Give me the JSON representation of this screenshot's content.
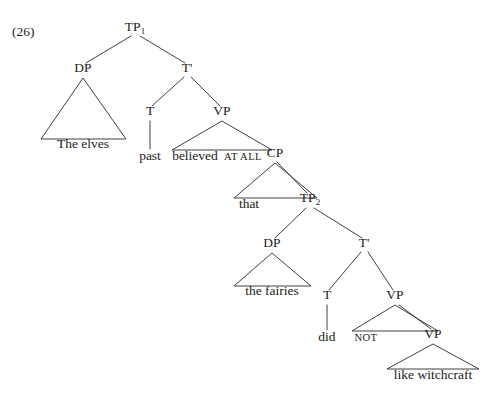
{
  "figure": {
    "example_number": "(26)",
    "caption": "",
    "ink_color": "#1a1a1a",
    "line_color": "#2b2b2b",
    "background_color": "#ffffff"
  },
  "tree": {
    "type": "constituency-syntax-tree",
    "nodes": [
      {
        "id": "tp1",
        "label": "TP",
        "subscript": "1",
        "x": 135,
        "y": 31
      },
      {
        "id": "dp1",
        "label": "DP",
        "subscript": "",
        "x": 83,
        "y": 72
      },
      {
        "id": "tbar1",
        "label": "T'",
        "subscript": "",
        "x": 187,
        "y": 72
      },
      {
        "id": "t1",
        "label": "T",
        "subscript": "",
        "x": 150,
        "y": 115
      },
      {
        "id": "vp1",
        "label": "VP",
        "subscript": "",
        "x": 222,
        "y": 115
      },
      {
        "id": "cp",
        "label": "CP",
        "subscript": "",
        "x": 275,
        "y": 157
      },
      {
        "id": "tp2",
        "label": "TP",
        "subscript": "2",
        "x": 310,
        "y": 202
      },
      {
        "id": "dp2",
        "label": "DP",
        "subscript": "",
        "x": 272,
        "y": 247
      },
      {
        "id": "tbar2",
        "label": "T'",
        "subscript": "",
        "x": 364,
        "y": 247
      },
      {
        "id": "t2",
        "label": "T",
        "subscript": "",
        "x": 327,
        "y": 299
      },
      {
        "id": "vp2",
        "label": "VP",
        "subscript": "",
        "x": 395,
        "y": 299
      },
      {
        "id": "vp3",
        "label": "VP",
        "subscript": "",
        "x": 433,
        "y": 338
      }
    ],
    "leaves": [
      {
        "id": "leaf-the-elves",
        "text": "The elves",
        "x": 83,
        "y": 148,
        "style": "normal"
      },
      {
        "id": "leaf-past",
        "text": "past",
        "x": 150,
        "y": 160,
        "style": "normal"
      },
      {
        "id": "leaf-believed",
        "text": "believed",
        "x": 195,
        "y": 160,
        "style": "normal"
      },
      {
        "id": "leaf-at-all",
        "text": "AT ALL",
        "x": 243,
        "y": 160,
        "style": "smallcaps"
      },
      {
        "id": "leaf-that",
        "text": "that",
        "x": 249,
        "y": 208,
        "style": "normal"
      },
      {
        "id": "leaf-the-fairies",
        "text": "the fairies",
        "x": 272,
        "y": 295,
        "style": "normal"
      },
      {
        "id": "leaf-did",
        "text": "did",
        "x": 327,
        "y": 341,
        "style": "normal"
      },
      {
        "id": "leaf-not",
        "text": "NOT",
        "x": 366,
        "y": 341,
        "style": "smallcaps"
      },
      {
        "id": "leaf-like-witchcraft",
        "text": "like witchcraft",
        "x": 433,
        "y": 379,
        "style": "normal"
      }
    ],
    "branches": [
      {
        "id": "tp1-dp1",
        "x1": 131,
        "y1": 36,
        "x2": 86,
        "y2": 63
      },
      {
        "id": "tp1-tbar1",
        "x1": 140,
        "y1": 36,
        "x2": 185,
        "y2": 63
      },
      {
        "id": "tbar1-t1",
        "x1": 184,
        "y1": 77,
        "x2": 152,
        "y2": 106
      },
      {
        "id": "tbar1-vp1",
        "x1": 191,
        "y1": 77,
        "x2": 220,
        "y2": 106
      },
      {
        "id": "t1-past",
        "x1": 150,
        "y1": 121,
        "x2": 150,
        "y2": 149
      },
      {
        "id": "cp-tp2",
        "x1": 277,
        "y1": 162,
        "x2": 307,
        "y2": 193
      },
      {
        "id": "tp2-dp2",
        "x1": 306,
        "y1": 208,
        "x2": 275,
        "y2": 238
      },
      {
        "id": "tp2-tbar2",
        "x1": 314,
        "y1": 208,
        "x2": 362,
        "y2": 238
      },
      {
        "id": "tbar2-t2",
        "x1": 361,
        "y1": 252,
        "x2": 329,
        "y2": 290
      },
      {
        "id": "tbar2-vp2",
        "x1": 368,
        "y1": 252,
        "x2": 393,
        "y2": 290
      },
      {
        "id": "t2-did",
        "x1": 327,
        "y1": 305,
        "x2": 327,
        "y2": 330
      },
      {
        "id": "vp2-vp3",
        "x1": 399,
        "y1": 305,
        "x2": 431,
        "y2": 329
      }
    ],
    "triangles": [
      {
        "id": "tri-dp1",
        "apex_x": 83,
        "apex_y": 78,
        "left_x": 41,
        "right_x": 126,
        "base_y": 139
      },
      {
        "id": "tri-vp1",
        "apex_x": 222,
        "apex_y": 121,
        "left_x": 172,
        "right_x": 272,
        "base_y": 150
      },
      {
        "id": "tri-cp",
        "apex_x": 275,
        "apex_y": 163,
        "left_x": 234,
        "right_x": 317,
        "base_y": 198
      },
      {
        "id": "tri-dp2",
        "apex_x": 272,
        "apex_y": 253,
        "left_x": 234,
        "right_x": 311,
        "base_y": 286
      },
      {
        "id": "tri-vp2",
        "apex_x": 395,
        "apex_y": 305,
        "left_x": 352,
        "right_x": 438,
        "base_y": 331
      },
      {
        "id": "tri-vp3",
        "apex_x": 433,
        "apex_y": 344,
        "left_x": 387,
        "right_x": 479,
        "base_y": 369
      }
    ]
  },
  "sentence": {
    "matrix_clause": "The elves past believed AT ALL",
    "embedded_clause": "that the fairies did NOT like witchcraft",
    "full_text": "The elves past believed AT ALL that the fairies did NOT like witchcraft"
  }
}
